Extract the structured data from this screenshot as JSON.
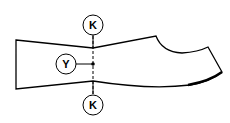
{
  "diagram": {
    "labels": {
      "top": "K",
      "left": "Y",
      "bottom": "K"
    },
    "colors": {
      "stroke": "#000000",
      "background": "#ffffff"
    }
  }
}
